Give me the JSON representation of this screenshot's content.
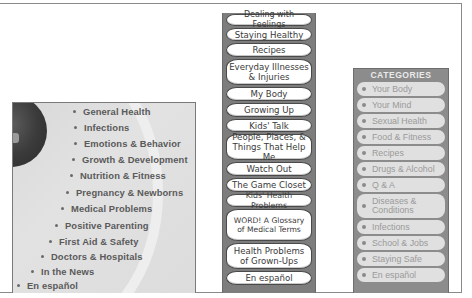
{
  "left_menu": {
    "items": [
      {
        "label": "General Health"
      },
      {
        "label": "Infections"
      },
      {
        "label": "Emotions & Behavior"
      },
      {
        "label": "Growth & Development"
      },
      {
        "label": "Nutrition & Fitness"
      },
      {
        "label": "Pregnancy & Newborns"
      },
      {
        "label": "Medical Problems"
      },
      {
        "label": "Positive Parenting"
      },
      {
        "label": "First Aid & Safety"
      },
      {
        "label": "Doctors & Hospitals"
      },
      {
        "label": "In the News"
      },
      {
        "label": "En español"
      }
    ]
  },
  "kids_menu": {
    "items": [
      {
        "label": "Dealing with Feelings"
      },
      {
        "label": "Staying Healthy"
      },
      {
        "label": "Recipes"
      },
      {
        "label": "Everyday Illnesses & Injuries"
      },
      {
        "label": "My Body"
      },
      {
        "label": "Growing Up"
      },
      {
        "label": "Kids' Talk"
      },
      {
        "label": "People, Places, & Things That Help Me"
      },
      {
        "label": "Watch Out"
      },
      {
        "label": "The Game Closet"
      },
      {
        "label": "Kids' Health Problems"
      },
      {
        "label": "WORD! A Glossary of Medical Terms"
      },
      {
        "label": "Health Problems of Grown-Ups"
      },
      {
        "label": "En español"
      }
    ]
  },
  "teens_menu": {
    "header": "CATEGORIES",
    "items": [
      {
        "label": "Your Body"
      },
      {
        "label": "Your Mind"
      },
      {
        "label": "Sexual Health"
      },
      {
        "label": "Food & Fitness"
      },
      {
        "label": "Recipes"
      },
      {
        "label": "Drugs & Alcohol"
      },
      {
        "label": "Q & A"
      },
      {
        "label": "Diseases & Conditions"
      },
      {
        "label": "Infections"
      },
      {
        "label": "School & Jobs"
      },
      {
        "label": "Staying Safe"
      },
      {
        "label": "En español"
      }
    ]
  },
  "colors": {
    "left_panel_bg": "#dcdcdc",
    "left_text": "#5a5a5a",
    "mid_column_bg": "#7d7d7d",
    "mid_button_bg": "#ffffff",
    "right_panel_bg": "#8c8c8c",
    "right_item_bg": "#e0e0e0",
    "right_item_text": "#9a9a9a"
  }
}
